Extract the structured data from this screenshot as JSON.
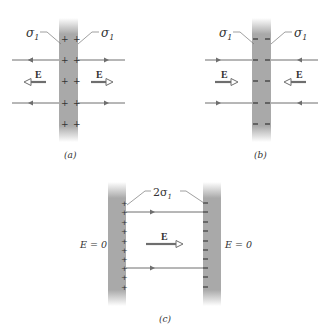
{
  "panels": {
    "a": {
      "caption": "(a)",
      "left_label": "σ",
      "left_label_sub": "1",
      "right_label": "σ",
      "right_label_sub": "1",
      "charge_sign": "+",
      "field_label_left": "E",
      "field_label_right": "E",
      "field_direction": "outward"
    },
    "b": {
      "caption": "(b)",
      "left_label": "σ",
      "left_label_sub": "1",
      "right_label": "σ",
      "right_label_sub": "1",
      "charge_sign": "−",
      "field_label_left": "E",
      "field_label_right": "E",
      "field_direction": "inward"
    },
    "c": {
      "caption": "(c)",
      "charge_label_prefix": "2σ",
      "charge_label_sub": "1",
      "left_outside_label": "E = 0",
      "right_outside_label": "E = 0",
      "field_label": "E",
      "left_plate_sign": "+",
      "right_plate_sign": "−"
    }
  },
  "colors": {
    "plate": "#a9a9a9",
    "line": "#6e6e6e",
    "text": "#333333",
    "background": "#ffffff"
  }
}
